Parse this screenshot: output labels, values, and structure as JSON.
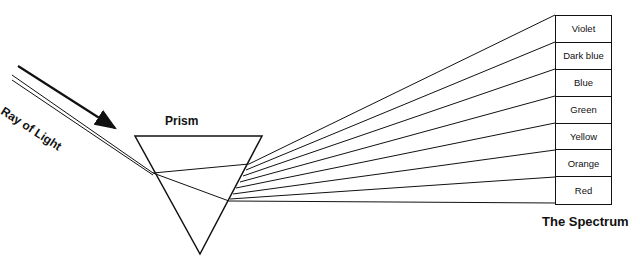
{
  "labels": {
    "ray": "Ray of Light",
    "prism": "Prism",
    "spectrum": "The Spectrum"
  },
  "spectrum_colors": [
    "Violet",
    "Dark blue",
    "Blue",
    "Green",
    "Yellow",
    "Orange",
    "Red"
  ]
}
